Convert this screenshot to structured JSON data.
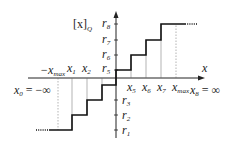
{
  "diagram": {
    "y_axis_label": "[x]",
    "y_axis_label_sub": "Q",
    "x_axis_label": "x",
    "colors": {
      "line": "#222222",
      "step": "#111111",
      "guide": "#555555"
    },
    "y_levels": [
      {
        "name": "r",
        "sub": "8",
        "y": 24
      },
      {
        "name": "r",
        "sub": "7",
        "y": 40
      },
      {
        "name": "r",
        "sub": "6",
        "y": 55
      },
      {
        "name": "r",
        "sub": "5",
        "y": 70
      },
      {
        "name": "r",
        "sub": "3",
        "y": 100
      },
      {
        "name": "r",
        "sub": "2",
        "y": 115
      },
      {
        "name": "r",
        "sub": "1",
        "y": 130
      }
    ],
    "x_ticks_top": [
      {
        "name": "−x",
        "sub": "max",
        "x": 58
      },
      {
        "name": "x",
        "sub": "1",
        "x": 72
      },
      {
        "name": "x",
        "sub": "2",
        "x": 87
      }
    ],
    "x_ticks_bottom": [
      {
        "name": "x",
        "sub": "5",
        "x": 131
      },
      {
        "name": "x",
        "sub": "6",
        "x": 146
      },
      {
        "name": "x",
        "sub": "7",
        "x": 161
      },
      {
        "name": "x",
        "sub": "max",
        "x": 176
      }
    ],
    "left_limit": {
      "name": "x",
      "sub": "0",
      "value": " = −∞"
    },
    "right_limit": {
      "name": "x",
      "sub": "8",
      "value": " = ∞"
    }
  }
}
